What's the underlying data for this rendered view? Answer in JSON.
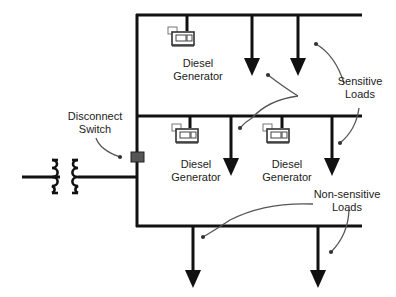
{
  "diagram": {
    "colors": {
      "line": "#111111",
      "switch": "#555555",
      "leader": "#555555",
      "background": "#ffffff"
    },
    "labels": {
      "gen_top": [
        "Diesel",
        "Generator"
      ],
      "gen_mid_left": [
        "Diesel",
        "Generator"
      ],
      "gen_mid_right": [
        "Diesel",
        "Generator"
      ],
      "sensitive": [
        "Sensitive",
        "Loads"
      ],
      "nonsensitive": [
        "Non-sensitive",
        "Loads"
      ],
      "disconnect": [
        "Disconnect",
        "Switch"
      ]
    },
    "nodes": [
      {
        "id": "utility-transformer",
        "type": "transformer"
      },
      {
        "id": "disconnect-switch",
        "type": "switch",
        "label": "Disconnect Switch"
      },
      {
        "id": "bus-top",
        "type": "bus"
      },
      {
        "id": "bus-middle",
        "type": "bus"
      },
      {
        "id": "bus-bottom",
        "type": "bus"
      },
      {
        "id": "gen-top",
        "type": "generator",
        "label": "Diesel Generator",
        "bus": "bus-top"
      },
      {
        "id": "gen-mid-left",
        "type": "generator",
        "label": "Diesel Generator",
        "bus": "bus-middle"
      },
      {
        "id": "gen-mid-right",
        "type": "generator",
        "label": "Diesel Generator",
        "bus": "bus-middle"
      },
      {
        "id": "load-top-1",
        "type": "load",
        "class": "Sensitive Loads",
        "bus": "bus-top"
      },
      {
        "id": "load-top-2",
        "type": "load",
        "class": "Sensitive Loads",
        "bus": "bus-top"
      },
      {
        "id": "load-mid-1",
        "type": "load",
        "class": "Sensitive Loads",
        "bus": "bus-middle"
      },
      {
        "id": "load-mid-2",
        "type": "load",
        "class": "Sensitive Loads",
        "bus": "bus-middle"
      },
      {
        "id": "load-bot-1",
        "type": "load",
        "class": "Non-sensitive Loads",
        "bus": "bus-bottom"
      },
      {
        "id": "load-bot-2",
        "type": "load",
        "class": "Non-sensitive Loads",
        "bus": "bus-bottom"
      }
    ]
  }
}
